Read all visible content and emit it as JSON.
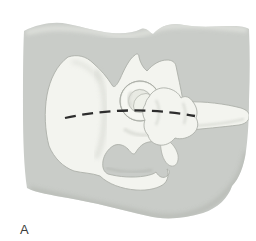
{
  "figure": {
    "panel_label": "A",
    "parts": [
      "soft-tissue-silhouette",
      "innominate-bone",
      "iliac-wing",
      "acetabulum-rim",
      "femoral-head",
      "greater-trochanter",
      "femoral-shaft",
      "ischial-ramus-hook",
      "dashed-reference-line",
      "panel-label"
    ]
  },
  "colors": {
    "background": "#ffffff",
    "soft_tissue": "#c9ccc8",
    "soft_tissue_highlight": "#e2e4df",
    "soft_tissue_shadow": "#b4b7b1",
    "bone_fill": "#f3f4ef",
    "bone_outline": "#adb0a9",
    "bone_shadow": "#d6d8d1",
    "socket_fill": "#e8eae3",
    "head_fill": "#eff1ea",
    "rim_highlight": "#f6f7f2",
    "dashed_line": "#2d2d2d",
    "label_color": "#3a3a3a"
  }
}
